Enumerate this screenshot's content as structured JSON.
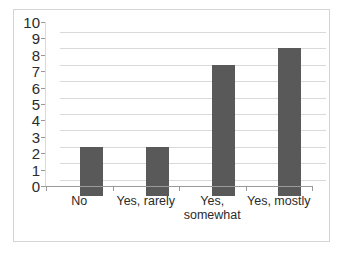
{
  "chart_data": {
    "type": "bar",
    "title": "",
    "subtitle": "",
    "xlabel": "",
    "ylabel": "",
    "categories": [
      "No",
      "Yes, rarely",
      "Yes, somewhat",
      "Yes, mostly"
    ],
    "category_lines": [
      [
        "No"
      ],
      [
        "Yes, rarely"
      ],
      [
        "Yes,",
        "somewhat"
      ],
      [
        "Yes, mostly"
      ]
    ],
    "values": [
      3,
      3,
      8,
      9
    ],
    "ylim": [
      0,
      10
    ],
    "y_ticks": [
      0,
      1,
      2,
      3,
      4,
      5,
      6,
      7,
      8,
      9,
      10
    ],
    "y_tick_labels": [
      "0",
      "1",
      "2",
      "3",
      "4",
      "5",
      "6",
      "7",
      "8",
      "9",
      "10"
    ],
    "grid": true,
    "grid_axis": "y",
    "legend": false,
    "legend_position": "none",
    "series": [
      {
        "name": "",
        "values": [
          3,
          3,
          8,
          9
        ]
      }
    ]
  },
  "style": {
    "bar_color": "#595959",
    "grid_color": "#d9d9d9",
    "axis_color": "#9a9a9a",
    "border_color": "#d4d4d4",
    "background": "#ffffff",
    "text_color": "#2b2b2b"
  }
}
